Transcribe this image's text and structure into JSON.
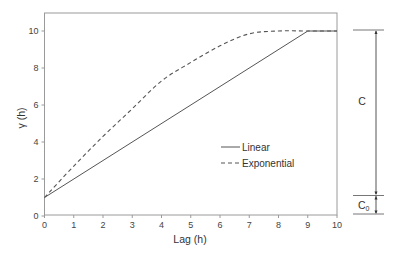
{
  "chart_data": {
    "type": "line",
    "title": "",
    "xlabel": "Lag (h)",
    "ylabel": "γ (h)",
    "xlim": [
      0,
      10
    ],
    "ylim": [
      0,
      11
    ],
    "xticks": [
      "0",
      "1",
      "2",
      "3",
      "4",
      "5",
      "6",
      "7",
      "8",
      "9",
      "10"
    ],
    "yticks": [
      "0",
      "2",
      "4",
      "6",
      "8",
      "10"
    ],
    "grid": false,
    "legend_position": "center-right inside plot",
    "series": [
      {
        "name": "Linear",
        "style": "solid",
        "x": [
          0,
          9,
          10
        ],
        "values": [
          1,
          10,
          10
        ]
      },
      {
        "name": "Exponential",
        "style": "dashed",
        "x": [
          0,
          1,
          2,
          3,
          4,
          5,
          6,
          7,
          8,
          9,
          10
        ],
        "values": [
          1,
          2.7,
          4.3,
          5.8,
          7.3,
          8.3,
          9.2,
          9.85,
          10,
          10,
          10
        ]
      }
    ],
    "annotations": [
      {
        "label": "C",
        "description": "Partial sill span from nugget (1) to sill (10)"
      },
      {
        "label": "C0",
        "description": "Nugget span from 0 to 1"
      }
    ]
  },
  "legend": {
    "linear": "Linear",
    "exponential": "Exponential"
  },
  "annotations": {
    "c_label": "C",
    "c0_label": "C",
    "c0_subscript": "0"
  },
  "axes": {
    "xlabel": "Lag (h)",
    "ylabel": "γ (h)",
    "xticks": [
      "0",
      "1",
      "2",
      "3",
      "4",
      "5",
      "6",
      "7",
      "8",
      "9",
      "10"
    ],
    "yticks": [
      "0",
      "2",
      "4",
      "6",
      "8",
      "10"
    ]
  }
}
